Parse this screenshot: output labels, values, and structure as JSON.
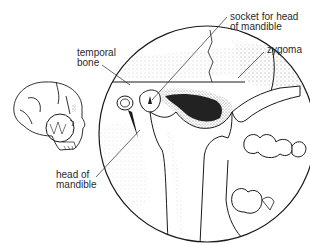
{
  "diagram": {
    "labels": {
      "temporal_bone": {
        "line1": "temporal",
        "line2": "bone"
      },
      "socket": {
        "line1": "socket for head",
        "line2": "of mandible"
      },
      "zygoma": {
        "line1": "zygoma"
      },
      "head_of_mandible": {
        "line1": "head of",
        "line2": "mandible"
      }
    },
    "colors": {
      "ink": "#1a1a1a",
      "label_text": "#2a2a2a",
      "stipple": "#9a9a9a",
      "dark_fill": "#222222",
      "background": "#ffffff"
    }
  }
}
